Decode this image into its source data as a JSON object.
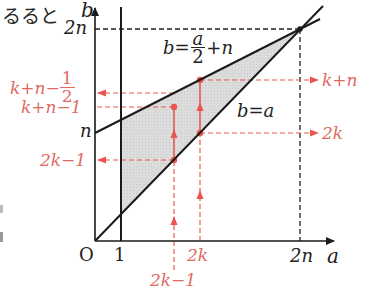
{
  "fragments": {
    "top_left_text": "るると",
    "left_edge_1": "",
    "left_edge_2": ""
  },
  "colors": {
    "axis": "#1a1a1a",
    "region_fill": "#d9d9d9",
    "accent_red": "#e8564f",
    "red_text": "#e06a62",
    "dashed_black": "#222222"
  },
  "axes": {
    "b_label": "b",
    "a_label": "a",
    "origin_label": "O",
    "one_label": "1",
    "two_n_b_label": "2n",
    "two_n_a_label": "2n",
    "n_label": "n"
  },
  "lines": {
    "upper_line_lhs": "b=",
    "upper_line_num": "a",
    "upper_line_den": "2",
    "upper_line_rhs": "+n",
    "lower_line": "b=a"
  },
  "red_labels": {
    "left": {
      "k_n_half_main": "k+n−",
      "k_n_half_num": "1",
      "k_n_half_den": "2",
      "k_n_minus_1": "k+n−1",
      "two_k_minus_1": "2k−1"
    },
    "right": {
      "k_plus_n": "k+n",
      "two_k": "2k"
    },
    "bottom": {
      "two_k": "2k",
      "two_k_minus_1": "2k−1"
    }
  }
}
